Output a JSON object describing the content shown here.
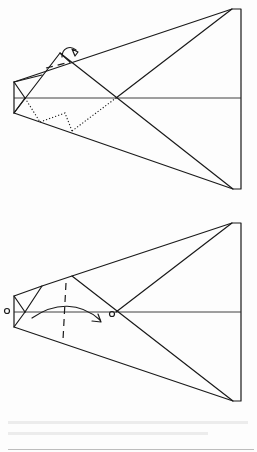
{
  "diagram": {
    "type": "origami-instruction",
    "steps": [
      {
        "name": "step-mountain-fold-tip",
        "description": "Mountain fold the nose tip behind along dotted lines",
        "symbols": [
          "mountain-fold-arrow",
          "mountain-fold-dotted-lines",
          "valley-fold-dot-dash-line"
        ],
        "points": {
          "right_top": [
            241,
            9
          ],
          "right_bottom": [
            241,
            189
          ],
          "center": [
            116,
            98
          ],
          "left_box_top": [
            14,
            82
          ],
          "left_box_bottom": [
            14,
            113
          ]
        }
      },
      {
        "name": "step-valley-fold-nose",
        "description": "Valley fold the nose forward so circle meets circle",
        "symbols": [
          "valley-fold-dashed-line",
          "fold-over-arrow",
          "reference-circle-left",
          "reference-circle-center"
        ],
        "points": {
          "right_top": [
            241,
            223
          ],
          "right_bottom": [
            241,
            401
          ],
          "center": [
            116,
            312
          ],
          "left_box_top": [
            14,
            296
          ],
          "left_box_bottom": [
            14,
            327
          ]
        }
      }
    ],
    "colors": {
      "line": "#1a1a1a",
      "paper": "#fdfdfd"
    }
  }
}
